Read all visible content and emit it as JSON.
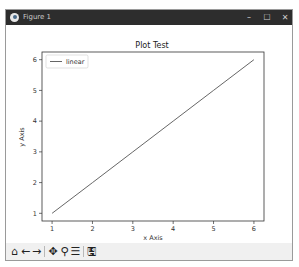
{
  "window": {
    "title": "Figure 1",
    "controls": {
      "minimize": "–",
      "maximize": "☐",
      "close": "✕"
    }
  },
  "toolbar": {
    "buttons": [
      {
        "name": "home",
        "icon": "home-icon",
        "glyph": "⌂"
      },
      {
        "name": "back",
        "icon": "arrow-left-icon",
        "glyph": "←"
      },
      {
        "name": "forward",
        "icon": "arrow-right-icon",
        "glyph": "→"
      },
      {
        "name": "pan",
        "icon": "move-icon",
        "glyph": "✥"
      },
      {
        "name": "zoom",
        "icon": "magnifier-icon",
        "glyph": "⚲"
      },
      {
        "name": "configure",
        "icon": "sliders-icon",
        "glyph": "☰"
      },
      {
        "name": "save",
        "icon": "floppy-disk-icon",
        "glyph": "🖫"
      }
    ]
  },
  "chart_data": {
    "type": "line",
    "title": "Plot Test",
    "xlabel": "x Axis",
    "ylabel": "y Axis",
    "x": [
      1,
      2,
      3,
      4,
      5,
      6
    ],
    "series": [
      {
        "name": "linear",
        "values": [
          1,
          2,
          3,
          4,
          5,
          6
        ],
        "color": "#555555"
      }
    ],
    "xticks": [
      "1",
      "2",
      "3",
      "4",
      "5",
      "6"
    ],
    "yticks": [
      "1",
      "2",
      "3",
      "4",
      "5",
      "6"
    ],
    "xlim": [
      0.75,
      6.25
    ],
    "ylim": [
      0.75,
      6.25
    ],
    "grid": false,
    "legend": {
      "position": "upper left",
      "entries": [
        "linear"
      ]
    }
  }
}
